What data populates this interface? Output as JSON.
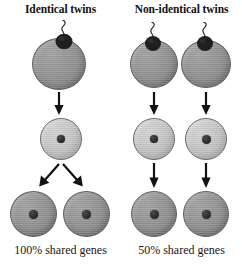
{
  "figure": {
    "kind": "biology-diagram",
    "panels": [
      {
        "id": "identical",
        "title": "Identical twins",
        "caption": "100% shared genes",
        "fertilisations": 1,
        "zygotes": 1,
        "embryos": 2,
        "split_stage": "after fertilisation (one zygote splits)",
        "arrow_style": "diverging"
      },
      {
        "id": "non-identical",
        "title": "Non-identical twins",
        "caption": "50% shared genes",
        "fertilisations": 2,
        "zygotes": 2,
        "embryos": 2,
        "split_stage": "two separate eggs fertilised",
        "arrow_style": "parallel"
      }
    ]
  },
  "titles": {
    "left": "Identical twins",
    "right": "Non-identical twins"
  },
  "captions": {
    "left": "100% shared genes",
    "right": "50% shared genes"
  },
  "icons": {
    "sperm": "sperm-cell-icon",
    "nucleus": "cell-nucleus-icon",
    "arrow_down": "arrow-down-icon",
    "arrow_down_left": "arrow-down-left-icon",
    "arrow_down_right": "arrow-down-right-icon"
  },
  "colors": {
    "background": "#ffffff",
    "egg_cell": "#949494",
    "zygote_cell": "#c8c8c8",
    "embryo_cell": "#949494",
    "nucleus": "#2b2b2b",
    "sperm_head": "#1f1f1f",
    "outline": "#5f5f5f",
    "text": "#121212",
    "arrow": "#111111"
  },
  "cells": {
    "left": {
      "egg": {
        "label": "fertilised egg",
        "diameter_px": 54
      },
      "zygote": {
        "label": "zygote",
        "diameter_px": 42
      },
      "embryo_a": {
        "label": "embryo 1",
        "diameter_px": 46
      },
      "embryo_b": {
        "label": "embryo 2",
        "diameter_px": 46
      }
    },
    "right": {
      "egg_a": {
        "label": "fertilised egg 1",
        "diameter_px": 48
      },
      "egg_b": {
        "label": "fertilised egg 2",
        "diameter_px": 50
      },
      "zygote_a": {
        "label": "zygote 1",
        "diameter_px": 42
      },
      "zygote_b": {
        "label": "zygote 2",
        "diameter_px": 42
      },
      "embryo_a": {
        "label": "embryo 1",
        "diameter_px": 46
      },
      "embryo_b": {
        "label": "embryo 2",
        "diameter_px": 46
      }
    }
  }
}
